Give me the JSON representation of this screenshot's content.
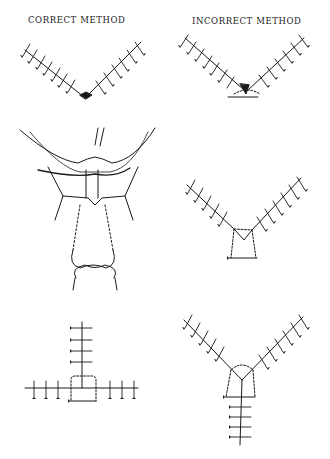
{
  "figure": {
    "columns": [
      {
        "id": "correct",
        "label": "CORRECT METHOD"
      },
      {
        "id": "incorrect",
        "label": "INCORRECT METHOD"
      }
    ],
    "panels": [
      {
        "id": "v-correct",
        "column": "correct",
        "row": 1,
        "description": "V-shaped suture line with stitches meeting cleanly at apex (buried apex stitch)"
      },
      {
        "id": "v-incorrect",
        "column": "incorrect",
        "row": 1,
        "description": "V-shaped suture line with stitches crowding at apex, strangulating the tip"
      },
      {
        "id": "tissue-corner-stitch",
        "column": "correct",
        "row": 2,
        "description": "Tissue cross-section showing half-buried corner stitch through flap tip with tied knot below"
      },
      {
        "id": "v-corner-stitch",
        "column": "incorrect",
        "row": 2,
        "description": "V-closure with dashed corner stitch loop beneath apex"
      },
      {
        "id": "t-corner-stitch",
        "column": "correct",
        "row": 3,
        "description": "T-shaped closure with dashed corner stitch loop at junction"
      },
      {
        "id": "y-corner-stitch",
        "column": "incorrect",
        "row": 3,
        "description": "Y-shaped closure with dashed corner stitch loop at junction"
      }
    ],
    "footnote": ""
  }
}
